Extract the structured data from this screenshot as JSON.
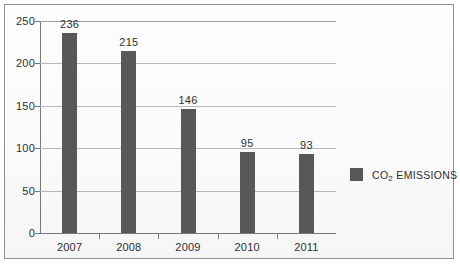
{
  "chart_data": {
    "type": "bar",
    "title": "",
    "xlabel": "",
    "ylabel": "",
    "categories": [
      "2007",
      "2008",
      "2009",
      "2010",
      "2011"
    ],
    "values": [
      236,
      215,
      146,
      95,
      93
    ],
    "value_labels": [
      "236",
      "215",
      "146",
      "95",
      "93"
    ],
    "series": [
      {
        "name": "CO2 EMISSIONS",
        "values": [
          236,
          215,
          146,
          95,
          93
        ]
      }
    ],
    "ylim": [
      0,
      250
    ],
    "yticks": [
      0,
      50,
      100,
      150,
      200,
      250
    ],
    "ytick_labels": [
      "0",
      "50",
      "100",
      "150",
      "200",
      "250"
    ],
    "grid": true,
    "grid_axis": "y",
    "legend_position": "right",
    "bar_color": "#58585a",
    "gridline_color": "#b6b8ba",
    "axis_color": "#76787b",
    "text_color": "#2e2f31",
    "background_color": "#fdfdfd",
    "border_color": "#8e9093"
  },
  "legend": {
    "entries": [
      {
        "label_prefix": "CO",
        "label_sub": "2",
        "label_suffix": " EMISSIONS",
        "full_label": "CO2 EMISSIONS",
        "color": "#58585a"
      }
    ]
  }
}
